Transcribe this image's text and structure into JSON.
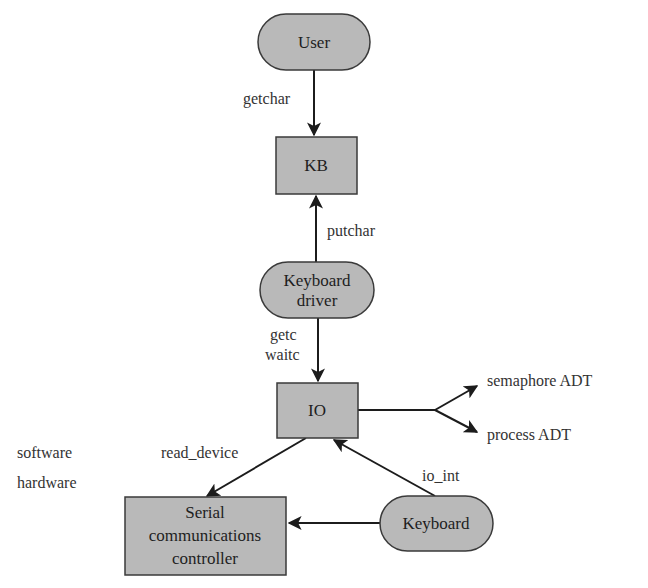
{
  "colors": {
    "node_fill": "#b9b9b9",
    "node_stroke": "#3a3a3a",
    "edge": "#1c1c1c",
    "background": "#ffffff"
  },
  "nodes": {
    "user": {
      "label": "User",
      "shape": "pill"
    },
    "kb": {
      "label": "KB",
      "shape": "box"
    },
    "keyboard_driver": {
      "line1": "Keyboard",
      "line2": "driver",
      "shape": "pill"
    },
    "io": {
      "label": "IO",
      "shape": "box"
    },
    "serial": {
      "line1": "Serial",
      "line2": "communications",
      "line3": "controller",
      "shape": "box"
    },
    "keyboard": {
      "label": "Keyboard",
      "shape": "pill"
    }
  },
  "edges": {
    "getchar": "getchar",
    "putchar": "putchar",
    "getc": "getc",
    "waitc": "waitc",
    "read_device": "read_device",
    "io_int": "io_int",
    "semaphore": "semaphore ADT",
    "process": "process ADT"
  },
  "layers": {
    "software": "software",
    "hardware": "hardware"
  }
}
